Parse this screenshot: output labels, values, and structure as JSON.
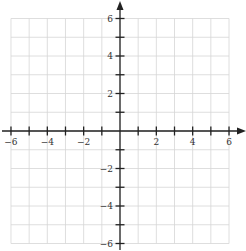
{
  "chart_data": {
    "type": "scatter",
    "title": "",
    "xlabel": "",
    "ylabel": "",
    "xlim": [
      -6,
      6
    ],
    "ylim": [
      -6,
      6
    ],
    "grid": true,
    "grid_step": 1,
    "x_ticks": [
      -6,
      -5,
      -4,
      -3,
      -2,
      -1,
      1,
      2,
      3,
      4,
      5,
      6
    ],
    "y_ticks": [
      -6,
      -5,
      -4,
      -3,
      -2,
      -1,
      1,
      2,
      3,
      4,
      5,
      6
    ],
    "x_tick_labels": [
      "-6",
      "-4",
      "-2",
      "2",
      "4",
      "6"
    ],
    "y_tick_labels": [
      "6",
      "4",
      "2",
      "-2",
      "-4",
      "-6"
    ],
    "series": [],
    "legend": null,
    "axis_arrows": [
      "positive-x",
      "positive-y"
    ]
  },
  "layout": {
    "origin_px": [
      120,
      131
    ],
    "unit_x_px": 18.17,
    "unit_y_px": 18.75,
    "colors": {
      "grid": "#d6d6d6",
      "axis": "#222222",
      "label": "#333333"
    }
  }
}
